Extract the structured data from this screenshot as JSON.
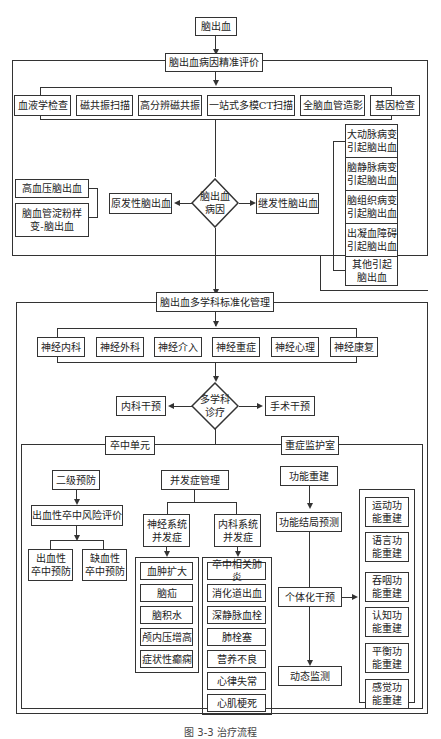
{
  "top": {
    "root": "脑出血",
    "eval_title": "脑出血病因精准评价"
  },
  "exams": [
    "血液学检查",
    "磁共振扫描",
    "高分辨磁共振",
    "一站式多模CT扫描",
    "全脑血管造影",
    "基因检查"
  ],
  "cause": {
    "diamond": "脑出血\n病因",
    "primary": "原发性脑出血",
    "secondary": "继发性脑出血",
    "primary_types": [
      "高血压脑出血",
      "脑血管淀粉样\n变-脑出血"
    ],
    "secondary_types": [
      "大动脉病变\n引起脑出血",
      "脑静脉病变\n引起脑出血",
      "脑组织病变\n引起脑出血",
      "出凝血障碍\n引起脑出血",
      "其他引起\n脑出血"
    ]
  },
  "mdt": {
    "title": "脑出血多学科标准化管理",
    "departments": [
      "神经内科",
      "神经外科",
      "神经介入",
      "神经重症",
      "神经心理",
      "神经康复"
    ],
    "diamond": "多学科\n诊疗",
    "medical": "内科干预",
    "surgical": "手术干预"
  },
  "stroke_unit": {
    "title": "卒中单元",
    "secondary_prevention": "二级预防",
    "risk_eval": "出血性卒中风险评价",
    "prevention": [
      "出血性\n卒中预防",
      "缺血性\n卒中预防"
    ],
    "complication_mgmt": "并发症管理",
    "neuro_comp": "神经系统\n并发症",
    "medical_comp": "内科系统\n并发症",
    "neuro_list": [
      "血肿扩大",
      "脑疝",
      "脑积水",
      "颅内压增高",
      "症状性癫痫"
    ],
    "medical_list": [
      "卒中相关肺炎",
      "消化道出血",
      "深静脉血栓",
      "肺栓塞",
      "营养不良",
      "心律失常",
      "心肌梗死"
    ]
  },
  "icu": {
    "title": "重症监护室",
    "rebuild": "功能重建",
    "prognosis": "功能结局预测",
    "individual": "个体化干预",
    "monitor": "动态监测",
    "rebuild_list": [
      "运动功\n能重建",
      "语言功\n能重建",
      "吞咽功\n能重建",
      "认知功\n能重建",
      "平衡功\n能重建",
      "感觉功\n能重建"
    ]
  },
  "caption": "图 3-3  治疗流程"
}
